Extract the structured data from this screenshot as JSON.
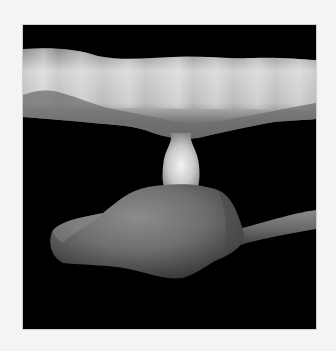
{
  "figure": {
    "background_color": "#000000",
    "page_color": "#f4f4f4",
    "structures": [
      {
        "name": "upper-band",
        "tone": "#c8c8c8"
      },
      {
        "name": "neck",
        "tone": "#e0e0e0"
      },
      {
        "name": "lower-body",
        "tone": "#6e6e6e"
      },
      {
        "name": "right-process",
        "tone": "#6a6a6a"
      }
    ]
  }
}
